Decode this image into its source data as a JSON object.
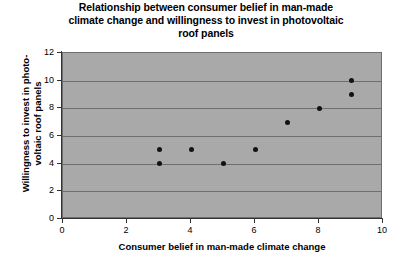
{
  "chart_data": {
    "type": "scatter",
    "title": "Relationship between consumer belief in man-made climate change and willingness to invest in photovoltaic roof panels",
    "title_lines": [
      "Relationship between consumer belief in man-made",
      "climate change and willingness to invest in photovoltaic",
      "roof panels"
    ],
    "xlabel": "Consumer belief in man-made climate change",
    "ylabel": "Willingness to invest in photo-voltaic roof panels",
    "ylabel_lines": [
      "Willingness to invest in photo-",
      "voltaic roof panels"
    ],
    "xlim": [
      0,
      10
    ],
    "ylim": [
      0,
      12
    ],
    "xticks": [
      0,
      2,
      4,
      6,
      8,
      10
    ],
    "yticks": [
      0,
      2,
      4,
      6,
      8,
      10,
      12
    ],
    "xtick_labels": [
      "0",
      "2",
      "4",
      "6",
      "8",
      "10"
    ],
    "ytick_labels": [
      "0",
      "2",
      "4",
      "6",
      "8",
      "10",
      "12"
    ],
    "grid": "horizontal",
    "legend": "none",
    "marker": "filled-circle",
    "marker_color": "#121212",
    "plot_background": "#a9a9a9",
    "gridline_color": "#6f6f6f",
    "points": [
      {
        "x": 3,
        "y": 5
      },
      {
        "x": 3,
        "y": 4
      },
      {
        "x": 4,
        "y": 5
      },
      {
        "x": 5,
        "y": 4
      },
      {
        "x": 6,
        "y": 5
      },
      {
        "x": 7,
        "y": 7
      },
      {
        "x": 8,
        "y": 8
      },
      {
        "x": 9,
        "y": 10
      },
      {
        "x": 9,
        "y": 9
      }
    ],
    "series": [
      {
        "name": "observations",
        "x": [
          3,
          3,
          4,
          5,
          6,
          7,
          8,
          9,
          9
        ],
        "values": [
          5,
          4,
          5,
          4,
          5,
          7,
          8,
          10,
          9
        ]
      }
    ]
  }
}
